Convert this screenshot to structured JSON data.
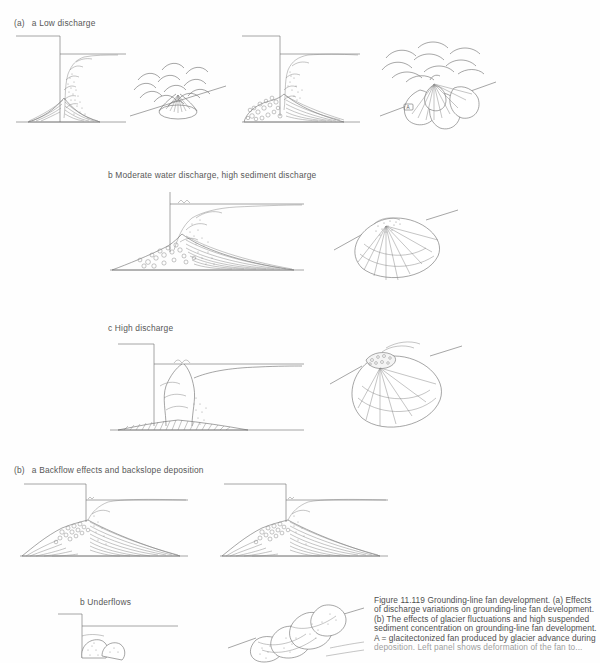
{
  "figure": {
    "panel_a_label": "(a)",
    "panel_b_label": "(b)",
    "sub_labels": {
      "a_a": "a Low discharge",
      "a_b": "b Moderate water discharge, high sediment discharge",
      "a_c": "c High discharge",
      "b_a": "a Backflow effects and backslope deposition",
      "b_b": "b Underflows"
    },
    "annotation_a": "A"
  },
  "caption": {
    "lines": [
      "Figure 11.119  Grounding-line fan development. (a) Effects",
      "of discharge variations on grounding-line fan development.",
      "(b) The effects of glacier fluctuations and high suspended",
      "sediment concentration on grounding-line fan development.",
      "A = glacitectonized fan produced by glacier advance during"
    ],
    "clipped_line": "deposition. Left panel shows deformation of the fan to..."
  },
  "colors": {
    "ink": "#6e6e6e",
    "text": "#575757",
    "background": "#ffffff"
  }
}
